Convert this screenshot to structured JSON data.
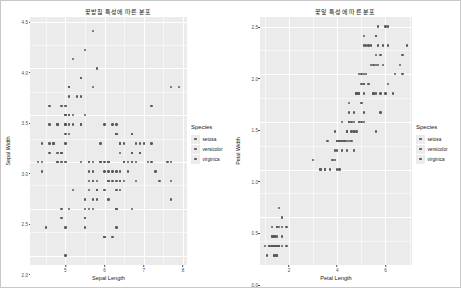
{
  "page": {
    "background": "#ffffff",
    "panel_background": "#ebebeb",
    "gridline_color": "#ffffff",
    "point_color": "#595959"
  },
  "charts": [
    {
      "id": "sepal-scatter",
      "title": "꽃받침 특성에 따른 분포",
      "xlabel": "Sepal Length",
      "ylabel": "Sepal Width",
      "legend_title": "Species"
    },
    {
      "id": "petal-scatter",
      "title": "꽃잎 특성에 따른 분포",
      "xlabel": "Petal Length",
      "ylabel": "Petal Width",
      "legend_title": "Species"
    }
  ],
  "legend": {
    "title": "Species",
    "items": [
      {
        "label": "setosa",
        "color": "#595959"
      },
      {
        "label": "versicolor",
        "color": "#595959"
      },
      {
        "label": "virginica",
        "color": "#595959"
      }
    ]
  },
  "chart_data": [
    {
      "type": "scatter",
      "id": "sepal-scatter",
      "title": "꽃받침 특성에 따른 분포",
      "xlabel": "Sepal Length",
      "ylabel": "Sepal Width",
      "xlim": [
        4.1,
        8.1
      ],
      "ylim": [
        1.9,
        4.55
      ],
      "xticks": [
        5,
        6,
        7,
        8
      ],
      "yticks": [
        2.0,
        2.5,
        3.0,
        3.5,
        4.0,
        4.5
      ],
      "xtick_labels": [
        "5",
        "6",
        "7",
        "8"
      ],
      "ytick_labels": [
        "2.0",
        "2.5",
        "3.0",
        "3.5",
        "4.0",
        "4.5"
      ],
      "grid": true,
      "legend_position": "right",
      "series": [
        {
          "name": "setosa",
          "color": "#595959",
          "x": [
            5.1,
            4.9,
            4.7,
            4.6,
            5.0,
            5.4,
            4.6,
            5.0,
            4.4,
            4.9,
            5.4,
            4.8,
            4.8,
            4.3,
            5.8,
            5.7,
            5.4,
            5.1,
            5.7,
            5.1,
            5.4,
            5.1,
            4.6,
            5.1,
            4.8,
            5.0,
            5.0,
            5.2,
            5.2,
            4.7,
            4.8,
            5.4,
            5.2,
            5.5,
            4.9,
            5.0,
            5.5,
            4.9,
            4.4,
            5.1,
            5.0,
            4.5,
            4.4,
            5.0,
            5.1,
            4.8,
            5.1,
            4.6,
            5.3,
            5.0
          ],
          "y": [
            3.5,
            3.0,
            3.2,
            3.1,
            3.6,
            3.9,
            3.4,
            3.4,
            2.9,
            3.1,
            3.7,
            3.4,
            3.0,
            3.0,
            4.0,
            4.4,
            3.9,
            3.5,
            3.8,
            3.8,
            3.4,
            3.7,
            3.6,
            3.3,
            3.4,
            3.0,
            3.4,
            3.5,
            3.4,
            3.2,
            3.1,
            3.4,
            4.1,
            4.2,
            3.1,
            3.2,
            3.5,
            3.6,
            3.0,
            3.4,
            3.5,
            2.3,
            3.2,
            3.5,
            3.8,
            3.0,
            3.8,
            3.2,
            3.7,
            3.3
          ]
        },
        {
          "name": "versicolor",
          "color": "#595959",
          "x": [
            7.0,
            6.4,
            6.9,
            5.5,
            6.5,
            5.7,
            6.3,
            4.9,
            6.6,
            5.2,
            5.0,
            5.9,
            6.0,
            6.1,
            5.6,
            6.7,
            5.6,
            5.8,
            6.2,
            5.6,
            5.9,
            6.1,
            6.3,
            6.1,
            6.4,
            6.6,
            6.8,
            6.7,
            6.0,
            5.7,
            5.5,
            5.5,
            5.8,
            6.0,
            5.4,
            6.0,
            6.7,
            6.3,
            5.6,
            5.5,
            5.5,
            6.1,
            5.8,
            5.0,
            5.6,
            5.7,
            5.7,
            6.2,
            5.1,
            5.7
          ],
          "y": [
            3.2,
            3.2,
            3.1,
            2.3,
            2.8,
            2.8,
            3.3,
            2.4,
            2.9,
            2.7,
            2.0,
            3.0,
            2.2,
            2.9,
            2.9,
            3.1,
            3.0,
            2.7,
            2.2,
            2.5,
            3.2,
            2.8,
            2.5,
            2.8,
            2.9,
            3.0,
            2.8,
            3.0,
            2.9,
            2.6,
            2.4,
            2.4,
            2.7,
            2.7,
            3.0,
            3.4,
            3.1,
            2.3,
            3.0,
            2.5,
            2.6,
            3.0,
            2.6,
            2.3,
            2.7,
            3.0,
            2.9,
            2.9,
            2.5,
            2.8
          ]
        },
        {
          "name": "virginica",
          "color": "#595959",
          "x": [
            6.3,
            5.8,
            7.1,
            6.3,
            6.5,
            7.6,
            4.9,
            7.3,
            6.7,
            7.2,
            6.5,
            6.4,
            6.8,
            5.7,
            5.8,
            6.4,
            6.5,
            7.7,
            7.7,
            6.0,
            6.9,
            5.6,
            7.7,
            6.3,
            6.7,
            7.2,
            6.2,
            6.1,
            6.4,
            7.2,
            7.4,
            7.9,
            6.4,
            6.3,
            6.1,
            7.7,
            6.3,
            6.4,
            6.0,
            6.9,
            6.7,
            6.9,
            5.8,
            6.8,
            6.7,
            6.7,
            6.3,
            6.5,
            6.2,
            5.9
          ],
          "y": [
            3.3,
            2.7,
            3.0,
            2.9,
            3.0,
            3.0,
            2.5,
            2.9,
            2.5,
            3.6,
            3.2,
            2.7,
            3.0,
            2.5,
            2.8,
            3.2,
            3.0,
            3.8,
            2.6,
            2.2,
            3.2,
            2.8,
            2.8,
            2.7,
            3.3,
            3.2,
            2.8,
            3.0,
            2.8,
            3.0,
            2.8,
            3.8,
            2.8,
            2.8,
            2.6,
            3.0,
            3.4,
            3.1,
            3.0,
            3.1,
            3.1,
            3.1,
            2.7,
            3.2,
            3.3,
            3.0,
            2.5,
            3.0,
            3.4,
            3.0
          ]
        }
      ]
    },
    {
      "type": "scatter",
      "id": "petal-scatter",
      "title": "꽃잎 특성에 따른 분포",
      "xlabel": "Petal Length",
      "ylabel": "Petal Width",
      "xlim": [
        0.8,
        7.1
      ],
      "ylim": [
        0.0,
        2.6
      ],
      "xticks": [
        2,
        4,
        6
      ],
      "yticks": [
        0.0,
        0.5,
        1.0,
        1.5,
        2.0,
        2.5
      ],
      "xtick_labels": [
        "2",
        "4",
        "6"
      ],
      "ytick_labels": [
        "0.0",
        "0.5",
        "1.0",
        "1.5",
        "2.0",
        "2.5"
      ],
      "grid": true,
      "legend_position": "right",
      "series": [
        {
          "name": "setosa",
          "color": "#595959",
          "x": [
            1.4,
            1.4,
            1.3,
            1.5,
            1.4,
            1.7,
            1.4,
            1.5,
            1.4,
            1.5,
            1.5,
            1.6,
            1.4,
            1.1,
            1.2,
            1.5,
            1.3,
            1.4,
            1.7,
            1.5,
            1.7,
            1.5,
            1.0,
            1.7,
            1.9,
            1.6,
            1.6,
            1.5,
            1.4,
            1.6,
            1.6,
            1.5,
            1.5,
            1.4,
            1.5,
            1.2,
            1.3,
            1.4,
            1.3,
            1.5,
            1.3,
            1.3,
            1.3,
            1.6,
            1.9,
            1.4,
            1.6,
            1.4,
            1.5,
            1.4
          ],
          "y": [
            0.2,
            0.2,
            0.2,
            0.2,
            0.2,
            0.4,
            0.3,
            0.2,
            0.2,
            0.1,
            0.2,
            0.2,
            0.1,
            0.1,
            0.2,
            0.4,
            0.4,
            0.3,
            0.3,
            0.3,
            0.2,
            0.4,
            0.2,
            0.5,
            0.2,
            0.2,
            0.4,
            0.2,
            0.2,
            0.2,
            0.2,
            0.4,
            0.1,
            0.2,
            0.2,
            0.2,
            0.2,
            0.1,
            0.2,
            0.2,
            0.3,
            0.3,
            0.2,
            0.6,
            0.4,
            0.3,
            0.2,
            0.2,
            0.2,
            0.2
          ]
        },
        {
          "name": "versicolor",
          "color": "#595959",
          "x": [
            4.7,
            4.5,
            4.9,
            4.0,
            4.6,
            4.5,
            4.7,
            3.3,
            4.6,
            3.9,
            3.5,
            4.2,
            4.0,
            4.7,
            3.6,
            4.4,
            4.5,
            4.1,
            4.5,
            3.9,
            4.8,
            4.0,
            4.9,
            4.7,
            4.3,
            4.4,
            4.8,
            5.0,
            4.5,
            3.5,
            3.8,
            3.7,
            3.9,
            5.1,
            4.5,
            4.5,
            4.7,
            4.4,
            4.1,
            4.0,
            4.4,
            4.6,
            4.0,
            3.3,
            4.2,
            4.2,
            4.2,
            4.3,
            3.0,
            4.1
          ],
          "y": [
            1.4,
            1.5,
            1.5,
            1.3,
            1.5,
            1.3,
            1.6,
            1.0,
            1.3,
            1.4,
            1.0,
            1.5,
            1.0,
            1.4,
            1.3,
            1.4,
            1.5,
            1.0,
            1.5,
            1.1,
            1.8,
            1.3,
            1.5,
            1.2,
            1.3,
            1.4,
            1.4,
            1.7,
            1.5,
            1.0,
            1.1,
            1.0,
            1.2,
            1.6,
            1.5,
            1.6,
            1.5,
            1.3,
            1.3,
            1.3,
            1.2,
            1.4,
            1.2,
            1.0,
            1.3,
            1.2,
            1.3,
            1.3,
            1.1,
            1.3
          ]
        },
        {
          "name": "virginica",
          "color": "#595959",
          "x": [
            6.0,
            5.1,
            5.9,
            5.6,
            5.8,
            6.6,
            4.5,
            6.3,
            5.8,
            6.1,
            5.1,
            5.3,
            5.5,
            5.0,
            5.1,
            5.3,
            5.5,
            6.7,
            6.9,
            5.0,
            5.7,
            4.9,
            6.7,
            4.9,
            5.7,
            6.0,
            4.8,
            4.9,
            5.6,
            5.8,
            6.1,
            6.4,
            5.6,
            5.1,
            5.6,
            6.1,
            5.6,
            5.5,
            4.8,
            5.4,
            5.6,
            5.1,
            5.1,
            5.9,
            5.7,
            5.2,
            5.0,
            5.2,
            5.4,
            5.1
          ],
          "y": [
            2.5,
            1.9,
            2.1,
            1.8,
            2.2,
            2.1,
            1.7,
            1.8,
            1.8,
            2.5,
            2.0,
            1.9,
            2.1,
            2.0,
            2.4,
            2.3,
            1.8,
            2.2,
            2.3,
            1.5,
            2.3,
            2.0,
            2.0,
            1.8,
            2.1,
            1.8,
            1.8,
            1.8,
            2.1,
            1.6,
            1.9,
            2.0,
            2.2,
            1.5,
            1.4,
            2.3,
            2.4,
            1.8,
            1.8,
            2.1,
            2.4,
            2.3,
            1.9,
            2.3,
            2.5,
            2.3,
            1.9,
            2.0,
            2.3,
            1.8
          ]
        }
      ]
    }
  ]
}
